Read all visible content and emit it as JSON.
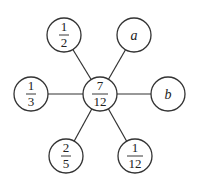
{
  "diagram": {
    "center": {
      "numerator": "7",
      "denominator": "12"
    },
    "nodes": [
      {
        "id": "top-left",
        "numerator": "1",
        "denominator": "2"
      },
      {
        "id": "top-right",
        "label": "a"
      },
      {
        "id": "left",
        "numerator": "1",
        "denominator": "3"
      },
      {
        "id": "right",
        "label": "b"
      },
      {
        "id": "bottom-left",
        "numerator": "2",
        "denominator": "5"
      },
      {
        "id": "bottom-right",
        "numerator": "1",
        "denominator": "12"
      }
    ]
  }
}
